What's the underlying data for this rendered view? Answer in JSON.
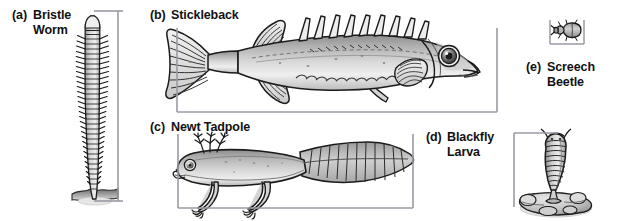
{
  "figure": {
    "background": "#ffffff",
    "width": 618,
    "height": 221,
    "ink_color": "#1a1a1a",
    "scalebar_color": "#8c8c96",
    "body_fill_light": "#e8e8e8",
    "body_fill_mid": "#bdbdbd",
    "body_fill_dark": "#8d8d8d"
  },
  "panels": [
    {
      "key": "a",
      "tag": "(a)",
      "name": "Bristle\nWorm",
      "name_flat": "Bristle Worm",
      "organism": "bristle-worm",
      "scalebar_orientation": "vertical"
    },
    {
      "key": "b",
      "tag": "(b)",
      "name": "Stickleback",
      "name_flat": "Stickleback",
      "organism": "stickleback",
      "scalebar_orientation": "horizontal"
    },
    {
      "key": "c",
      "tag": "(c)",
      "name": "Newt Tadpole",
      "name_flat": "Newt Tadpole",
      "organism": "newt-tadpole",
      "scalebar_orientation": "horizontal"
    },
    {
      "key": "d",
      "tag": "(d)",
      "name": "Blackfly\nLarva",
      "name_flat": "Blackfly Larva",
      "organism": "blackfly-larva",
      "scalebar_orientation": "vertical"
    },
    {
      "key": "e",
      "tag": "(e)",
      "name": "Screech\nBeetle",
      "name_flat": "Screech Beetle",
      "organism": "screech-beetle",
      "scalebar_orientation": "horizontal"
    }
  ]
}
